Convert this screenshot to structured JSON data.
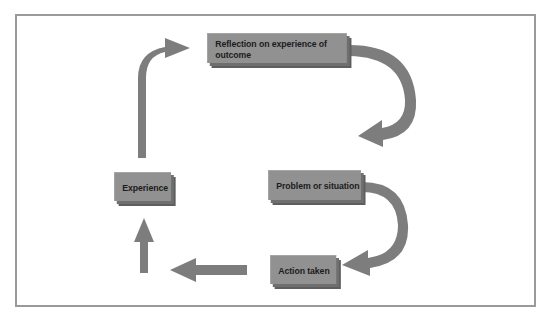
{
  "diagram": {
    "type": "cycle",
    "nodes": [
      {
        "id": "reflection",
        "label": "Reflection on experience of outcome"
      },
      {
        "id": "experience",
        "label": "Experience"
      },
      {
        "id": "problem",
        "label": "Problem or situation"
      },
      {
        "id": "action",
        "label": "Action taken"
      }
    ],
    "edges": [
      {
        "from": "problem",
        "to": "action"
      },
      {
        "from": "action",
        "to": "experience"
      },
      {
        "from": "experience",
        "to": "reflection"
      },
      {
        "from": "reflection",
        "to": "problem"
      }
    ],
    "colors": {
      "box_fill": "#919191",
      "box_shadow": "#5e5e5e",
      "arrow": "#7d7d7d",
      "frame": "#9a9a9a",
      "text": "#1c1c1c"
    }
  }
}
